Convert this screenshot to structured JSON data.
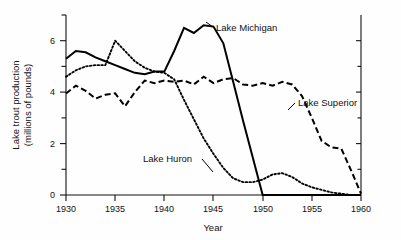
{
  "chart_data": {
    "type": "line",
    "title": "",
    "xlabel": "Year",
    "ylabel": "Lake trout production (millions of pounds)",
    "xlim": [
      1930,
      1960
    ],
    "ylim": [
      0,
      7
    ],
    "grid": false,
    "legend_position": "inline-annotations",
    "x_ticks": [
      1930,
      1935,
      1940,
      1945,
      1950,
      1955,
      1960
    ],
    "x_minor_ticks": [],
    "y_ticks": [
      0,
      2,
      4,
      6
    ],
    "y_minor_ticks": [
      1,
      3,
      5,
      7
    ],
    "x": [
      1930,
      1931,
      1932,
      1933,
      1934,
      1935,
      1936,
      1937,
      1938,
      1939,
      1940,
      1941,
      1942,
      1943,
      1944,
      1945,
      1946,
      1947,
      1948,
      1949,
      1950,
      1951,
      1952,
      1953,
      1954,
      1955,
      1956,
      1957,
      1958,
      1959,
      1960
    ],
    "series": [
      {
        "name": "Lake Michigan",
        "style": "solid",
        "values": [
          5.3,
          5.6,
          5.55,
          5.35,
          5.2,
          5.05,
          4.9,
          4.75,
          4.7,
          4.8,
          4.8,
          5.6,
          6.5,
          6.3,
          6.6,
          6.55,
          5.9,
          4.4,
          2.9,
          1.45,
          0.0,
          0.0,
          0.0,
          0.0,
          0.0,
          0.0,
          0.0,
          0.0,
          0.0,
          0.0,
          0.0
        ]
      },
      {
        "name": "Lake Superior",
        "style": "dashed",
        "values": [
          3.95,
          4.25,
          4.05,
          3.75,
          3.9,
          3.95,
          3.45,
          4.0,
          4.45,
          4.35,
          4.45,
          4.4,
          4.45,
          4.3,
          4.6,
          4.35,
          4.5,
          4.55,
          4.3,
          4.25,
          4.35,
          4.25,
          4.4,
          4.3,
          3.85,
          3.0,
          2.1,
          1.85,
          1.8,
          0.95,
          0.05
        ]
      },
      {
        "name": "Lake Huron",
        "style": "dotted",
        "values": [
          4.6,
          4.85,
          5.0,
          5.05,
          5.05,
          6.0,
          5.6,
          5.2,
          4.95,
          4.8,
          4.75,
          4.5,
          3.7,
          2.95,
          2.2,
          1.6,
          1.05,
          0.65,
          0.5,
          0.5,
          0.6,
          0.8,
          0.85,
          0.7,
          0.45,
          0.3,
          0.2,
          0.1,
          0.05,
          0.0,
          0.0
        ]
      }
    ],
    "annotations": [
      {
        "text": "Lake Michigan",
        "x": 1944.5,
        "y": 6.4
      },
      {
        "text": "Lake Superior",
        "x": 1953.5,
        "y": 3.85
      },
      {
        "text": "Lake Huron",
        "x": 1937.5,
        "y": 1.55
      }
    ]
  }
}
